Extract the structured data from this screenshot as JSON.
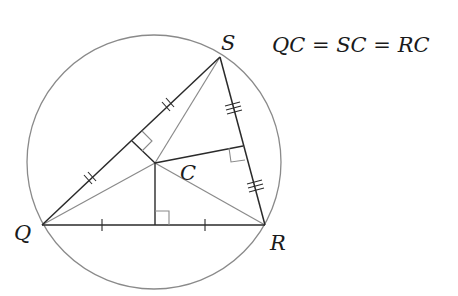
{
  "diagram": {
    "type": "geometry-circumcircle",
    "equation": "QC = SC = RC",
    "points": {
      "Q": {
        "label": "Q",
        "x": 42,
        "y": 225
      },
      "R": {
        "label": "R",
        "x": 265,
        "y": 225
      },
      "S": {
        "label": "S",
        "x": 220,
        "y": 57
      },
      "C": {
        "label": "C",
        "x": 155,
        "y": 163
      }
    },
    "circle": {
      "cx": 154,
      "cy": 162,
      "r": 127,
      "center_label": "C"
    },
    "tick_marks": {
      "QR": 1,
      "QS": 2,
      "SR": 3
    },
    "colors": {
      "triangle": "#2a2a2a",
      "auxiliary": "#8a8a8a",
      "circle": "#8a8a8a"
    }
  }
}
